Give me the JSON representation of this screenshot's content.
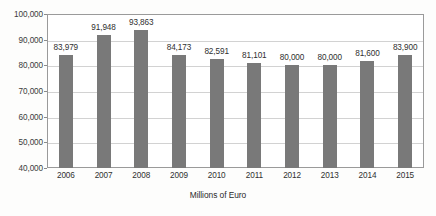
{
  "chart_data": {
    "type": "bar",
    "title": "",
    "subtitle": "",
    "xlabel": "Millions of Euro",
    "ylabel": "",
    "categories": [
      "2006",
      "2007",
      "2008",
      "2009",
      "2010",
      "2011",
      "2012",
      "2013",
      "2014",
      "2015"
    ],
    "values": [
      83979,
      91948,
      93863,
      84173,
      82591,
      81101,
      80000,
      80000,
      81600,
      83900
    ],
    "value_labels": [
      "83,979",
      "91,948",
      "93,863",
      "84,173",
      "82,591",
      "81,101",
      "80,000",
      "80,000",
      "81,600",
      "83,900"
    ],
    "ylim": [
      40000,
      100000
    ],
    "ytick_values": [
      40000,
      50000,
      60000,
      70000,
      80000,
      90000,
      100000
    ],
    "ytick_labels": [
      "40,000",
      "50,000",
      "60,000",
      "70,000",
      "80,000",
      "90,000",
      "100,000"
    ],
    "grid": true,
    "legend": "none",
    "bar_color": "#797979",
    "frame_color": "#9a9a9a",
    "gridline_color": "#d2d2d2",
    "background_color": "#ffffff",
    "series": [
      {
        "name": "",
        "values": [
          83979,
          91948,
          93863,
          84173,
          82591,
          81101,
          80000,
          80000,
          81600,
          83900
        ]
      }
    ]
  }
}
